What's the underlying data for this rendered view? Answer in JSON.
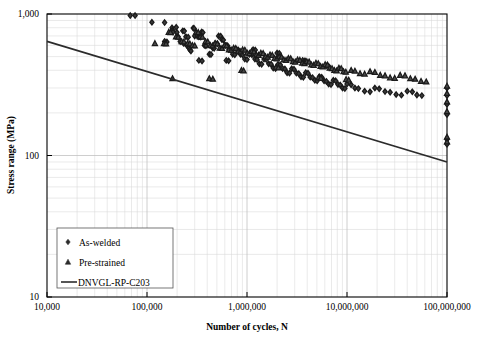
{
  "chart_data": {
    "type": "scatter",
    "title": "",
    "xlabel": "Number of cycles, N",
    "ylabel": "Stress range (MPa)",
    "xscale": "log",
    "yscale": "log",
    "xlim": [
      10000,
      100000000
    ],
    "ylim": [
      10,
      1000
    ],
    "grid": true,
    "minor_grid": true,
    "legend_position": "bottom-left",
    "xticks": [
      10000,
      100000,
      1000000,
      10000000,
      100000000
    ],
    "xtick_labels": [
      "10,000",
      "100,000",
      "1,000,000",
      "10,000,000",
      "100,000,000"
    ],
    "yticks": [
      10,
      100,
      1000
    ],
    "ytick_labels": [
      "10",
      "100",
      "1,000"
    ],
    "series": [
      {
        "name": "As-welded",
        "marker": "diamond",
        "color": "#2b2b2b",
        "points": [
          [
            68000,
            975
          ],
          [
            76000,
            975
          ],
          [
            112000,
            875
          ],
          [
            150000,
            870
          ],
          [
            178000,
            800
          ],
          [
            180000,
            770
          ],
          [
            182000,
            745
          ],
          [
            205000,
            690
          ],
          [
            215000,
            640
          ],
          [
            232000,
            620
          ],
          [
            250000,
            600
          ],
          [
            263000,
            575
          ],
          [
            268000,
            560
          ],
          [
            275000,
            548
          ],
          [
            150000,
            640
          ],
          [
            158000,
            635
          ],
          [
            196000,
            805
          ],
          [
            199000,
            742
          ],
          [
            228000,
            760
          ],
          [
            236000,
            757
          ],
          [
            290000,
            795
          ],
          [
            296000,
            790
          ],
          [
            300000,
            700
          ],
          [
            318000,
            700
          ],
          [
            330000,
            690
          ],
          [
            345000,
            688
          ],
          [
            352000,
            745
          ],
          [
            362000,
            740
          ],
          [
            375000,
            600
          ],
          [
            388000,
            596
          ],
          [
            420000,
            520
          ],
          [
            436000,
            518
          ],
          [
            455000,
            575
          ],
          [
            470000,
            573
          ],
          [
            520000,
            700
          ],
          [
            545000,
            697
          ],
          [
            560000,
            660
          ],
          [
            580000,
            655
          ],
          [
            610000,
            600
          ],
          [
            640000,
            596
          ],
          [
            660000,
            560
          ],
          [
            690000,
            556
          ],
          [
            720000,
            520
          ],
          [
            755000,
            516
          ],
          [
            790000,
            560
          ],
          [
            820000,
            556
          ],
          [
            860000,
            520
          ],
          [
            900000,
            516
          ],
          [
            950000,
            480
          ],
          [
            1000000,
            476
          ],
          [
            1060000,
            520
          ],
          [
            1120000,
            516
          ],
          [
            1200000,
            480
          ],
          [
            1260000,
            476
          ],
          [
            1330000,
            445
          ],
          [
            1400000,
            442
          ],
          [
            1480000,
            480
          ],
          [
            1560000,
            476
          ],
          [
            1650000,
            445
          ],
          [
            1740000,
            442
          ],
          [
            1830000,
            415
          ],
          [
            1930000,
            412
          ],
          [
            2040000,
            440
          ],
          [
            2150000,
            437
          ],
          [
            2270000,
            412
          ],
          [
            2390000,
            409
          ],
          [
            2520000,
            385
          ],
          [
            2660000,
            382
          ],
          [
            2800000,
            410
          ],
          [
            2950000,
            407
          ],
          [
            3120000,
            382
          ],
          [
            3290000,
            379
          ],
          [
            3470000,
            360
          ],
          [
            3660000,
            357
          ],
          [
            3860000,
            385
          ],
          [
            4070000,
            382
          ],
          [
            4290000,
            358
          ],
          [
            4520000,
            355
          ],
          [
            4770000,
            340
          ],
          [
            5030000,
            337
          ],
          [
            5300000,
            360
          ],
          [
            5590000,
            357
          ],
          [
            5900000,
            337
          ],
          [
            6220000,
            334
          ],
          [
            6560000,
            320
          ],
          [
            6920000,
            317
          ],
          [
            7300000,
            340
          ],
          [
            7700000,
            337
          ],
          [
            8120000,
            318
          ],
          [
            8560000,
            315
          ],
          [
            9030000,
            300
          ],
          [
            9520000,
            297
          ],
          [
            10000000,
            320
          ],
          [
            11000000,
            316
          ],
          [
            12000000,
            300
          ],
          [
            13000000,
            297
          ],
          [
            15000000,
            285
          ],
          [
            17000000,
            282
          ],
          [
            19000000,
            300
          ],
          [
            21000000,
            296
          ],
          [
            24000000,
            283
          ],
          [
            27000000,
            280
          ],
          [
            31000000,
            270
          ],
          [
            35000000,
            267
          ],
          [
            40000000,
            285
          ],
          [
            45000000,
            282
          ],
          [
            50000000,
            268
          ],
          [
            56000000,
            265
          ],
          [
            100000000,
            300
          ],
          [
            100000000,
            265
          ],
          [
            100000000,
            230
          ],
          [
            100000000,
            195
          ],
          [
            100000000,
            130
          ],
          [
            100000000,
            120
          ],
          [
            330000,
            470
          ],
          [
            355000,
            466
          ],
          [
            245000,
            690
          ],
          [
            258000,
            686
          ],
          [
            480000,
            620
          ],
          [
            505000,
            617
          ],
          [
            620000,
            470
          ],
          [
            655000,
            467
          ],
          [
            1150000,
            560
          ],
          [
            1210000,
            557
          ],
          [
            2000000,
            530
          ],
          [
            2100000,
            527
          ],
          [
            3600000,
            470
          ],
          [
            3800000,
            467
          ],
          [
            6200000,
            430
          ],
          [
            6550000,
            427
          ]
        ]
      },
      {
        "name": "Pre-strained",
        "marker": "triangle",
        "color": "#2b2b2b",
        "points": [
          [
            148000,
            620
          ],
          [
            155000,
            617
          ],
          [
            165000,
            745
          ],
          [
            172000,
            742
          ],
          [
            195000,
            690
          ],
          [
            205000,
            687
          ],
          [
            222000,
            640
          ],
          [
            234000,
            637
          ],
          [
            255000,
            620
          ],
          [
            268000,
            617
          ],
          [
            285000,
            600
          ],
          [
            300000,
            597
          ],
          [
            180000,
            350
          ],
          [
            120000,
            620
          ],
          [
            310000,
            745
          ],
          [
            325000,
            742
          ],
          [
            340000,
            690
          ],
          [
            358000,
            687
          ],
          [
            385000,
            640
          ],
          [
            405000,
            637
          ],
          [
            430000,
            600
          ],
          [
            452000,
            597
          ],
          [
            480000,
            620
          ],
          [
            505000,
            617
          ],
          [
            535000,
            575
          ],
          [
            562000,
            572
          ],
          [
            595000,
            600
          ],
          [
            625000,
            597
          ],
          [
            660000,
            560
          ],
          [
            695000,
            557
          ],
          [
            735000,
            575
          ],
          [
            772000,
            572
          ],
          [
            815000,
            545
          ],
          [
            858000,
            542
          ],
          [
            905000,
            560
          ],
          [
            952000,
            557
          ],
          [
            1005000,
            530
          ],
          [
            1058000,
            527
          ],
          [
            1115000,
            545
          ],
          [
            1175000,
            542
          ],
          [
            1240000,
            515
          ],
          [
            1305000,
            512
          ],
          [
            1375000,
            530
          ],
          [
            1450000,
            527
          ],
          [
            1530000,
            500
          ],
          [
            1610000,
            497
          ],
          [
            1700000,
            515
          ],
          [
            1790000,
            512
          ],
          [
            1890000,
            487
          ],
          [
            1990000,
            484
          ],
          [
            2100000,
            500
          ],
          [
            2215000,
            497
          ],
          [
            2335000,
            475
          ],
          [
            2460000,
            472
          ],
          [
            2595000,
            487
          ],
          [
            2735000,
            484
          ],
          [
            2885000,
            462
          ],
          [
            3040000,
            459
          ],
          [
            3205000,
            475
          ],
          [
            3380000,
            472
          ],
          [
            3565000,
            450
          ],
          [
            3760000,
            447
          ],
          [
            3960000,
            462
          ],
          [
            4180000,
            459
          ],
          [
            4400000,
            438
          ],
          [
            4640000,
            435
          ],
          [
            4890000,
            450
          ],
          [
            5160000,
            447
          ],
          [
            5440000,
            427
          ],
          [
            5730000,
            424
          ],
          [
            6050000,
            440
          ],
          [
            6380000,
            437
          ],
          [
            6720000,
            415
          ],
          [
            7090000,
            412
          ],
          [
            7470000,
            400
          ],
          [
            7880000,
            397
          ],
          [
            8300000,
            415
          ],
          [
            8750000,
            412
          ],
          [
            9230000,
            392
          ],
          [
            9730000,
            389
          ],
          [
            11000000,
            400
          ],
          [
            12000000,
            396
          ],
          [
            13500000,
            380
          ],
          [
            15000000,
            377
          ],
          [
            17000000,
            392
          ],
          [
            19000000,
            388
          ],
          [
            21500000,
            370
          ],
          [
            24000000,
            367
          ],
          [
            27000000,
            355
          ],
          [
            30000000,
            352
          ],
          [
            34000000,
            370
          ],
          [
            38000000,
            367
          ],
          [
            43000000,
            350
          ],
          [
            48000000,
            347
          ],
          [
            55000000,
            335
          ],
          [
            62000000,
            332
          ],
          [
            100000000,
            310
          ],
          [
            100000000,
            275
          ],
          [
            100000000,
            240
          ],
          [
            100000000,
            205
          ],
          [
            100000000,
            135
          ],
          [
            100000000,
            125
          ],
          [
            420000,
            350
          ],
          [
            455000,
            347
          ],
          [
            880000,
            400
          ],
          [
            925000,
            397
          ],
          [
            1950000,
            420
          ],
          [
            2060000,
            417
          ],
          [
            5200000,
            355
          ],
          [
            5480000,
            352
          ],
          [
            9800000,
            345
          ],
          [
            10400000,
            342
          ]
        ]
      }
    ],
    "design_line": {
      "name": "DNVGL-RP-C203",
      "color": "#2b2b2b",
      "points": [
        [
          10000,
          640
        ],
        [
          100000000,
          90
        ]
      ]
    }
  },
  "legend": {
    "items": [
      {
        "label": "As-welded",
        "marker": "diamond"
      },
      {
        "label": "Pre-strained",
        "marker": "triangle"
      },
      {
        "label": "DNVGL-RP-C203",
        "marker": "line"
      }
    ]
  }
}
